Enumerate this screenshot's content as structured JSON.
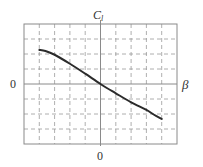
{
  "chart_data": {
    "type": "line",
    "title": "",
    "xlabel": "β",
    "ylabel": "C_l",
    "ylabel_main": "C",
    "ylabel_sub": "l",
    "x_tick_labels": [
      "0"
    ],
    "y_tick_labels": [
      "0"
    ],
    "xlim": [
      -5,
      5
    ],
    "ylim": [
      -4,
      4
    ],
    "grid": true,
    "grid_style": "dashed",
    "grid_x_divisions": 10,
    "grid_y_divisions": 8,
    "legend": null,
    "series": [
      {
        "name": "C_l vs β",
        "x": [
          -4,
          -3.6,
          -3,
          -2,
          -1,
          0,
          1,
          2,
          3,
          3.5,
          4
        ],
        "y": [
          2.27,
          2.2,
          1.95,
          1.35,
          0.69,
          0,
          -0.62,
          -1.22,
          -1.73,
          -2.05,
          -2.33
        ]
      }
    ],
    "colors": {
      "curve": "#2b2b2b",
      "grid": "#9a9a9a",
      "axis": "#8a8a8a",
      "frame": "#8a8a8a"
    }
  },
  "labels": {
    "ylabel_main": "C",
    "ylabel_sub": "l",
    "xlabel": "β",
    "ytick_zero": "0",
    "xtick_zero": "0"
  }
}
